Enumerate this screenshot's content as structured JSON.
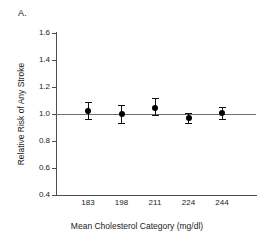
{
  "figure": {
    "panel_label": "A."
  },
  "chart_data": {
    "type": "scatter",
    "title": "",
    "subtitle": "",
    "xlabel": "Mean Cholesterol Category (mg/dl)",
    "ylabel": "Relative Risk of Any Stroke",
    "categories": [
      "183",
      "198",
      "211",
      "224",
      "244"
    ],
    "values": [
      1.02,
      1.0,
      1.045,
      0.97,
      1.005
    ],
    "error_low": [
      0.96,
      0.93,
      0.99,
      0.93,
      0.96
    ],
    "error_high": [
      1.09,
      1.07,
      1.12,
      1.01,
      1.05
    ],
    "points": [
      {
        "x": "183",
        "rr": 1.02,
        "ci_low": 0.96,
        "ci_high": 1.09
      },
      {
        "x": "198",
        "rr": 1.0,
        "ci_low": 0.93,
        "ci_high": 1.07
      },
      {
        "x": "211",
        "rr": 1.045,
        "ci_low": 0.99,
        "ci_high": 1.12
      },
      {
        "x": "224",
        "rr": 0.97,
        "ci_low": 0.93,
        "ci_high": 1.01
      },
      {
        "x": "244",
        "rr": 1.005,
        "ci_low": 0.96,
        "ci_high": 1.05
      }
    ],
    "ylim": [
      0.4,
      1.6
    ],
    "yticks": [
      "0.4",
      "0.6",
      "0.8",
      "1.0",
      "1.2",
      "1.4",
      "1.6"
    ],
    "ytick_values": [
      0.4,
      0.6,
      0.8,
      1.0,
      1.2,
      1.4,
      1.6
    ],
    "xticks": [
      "183",
      "198",
      "211",
      "224",
      "244"
    ],
    "reference_line": 1.0,
    "grid": false,
    "legend": "none",
    "marker_color": "#000000",
    "error_bar_color": "#111111",
    "axis_color": "#4d4d4d",
    "reference_line_color": "#6e6e6e",
    "background_color": "#ffffff"
  }
}
